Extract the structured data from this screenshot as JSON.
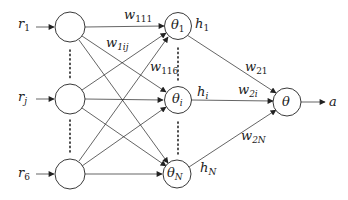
{
  "diagram": {
    "inputs": [
      {
        "symbol": "r",
        "sub": "1"
      },
      {
        "symbol": "r",
        "sub": "j"
      },
      {
        "symbol": "r",
        "sub": "6"
      }
    ],
    "hidden": [
      {
        "symbol": "θ",
        "sub": "1",
        "output": "h",
        "output_sub": "1"
      },
      {
        "symbol": "θ",
        "sub": "i",
        "output": "h",
        "output_sub": "i"
      },
      {
        "symbol": "θ",
        "sub": "N",
        "output": "h",
        "output_sub": "N"
      }
    ],
    "output_node": {
      "symbol": "θ",
      "result": "a"
    },
    "layer1_weights": [
      {
        "symbol": "w",
        "sub": "111"
      },
      {
        "symbol": "w",
        "sub": "1ij"
      },
      {
        "symbol": "w",
        "sub": "116"
      }
    ],
    "layer2_weights": [
      {
        "symbol": "w",
        "sub": "21"
      },
      {
        "symbol": "w",
        "sub": "2i"
      },
      {
        "symbol": "w",
        "sub": "2N"
      }
    ],
    "colors": {
      "stroke": "#222222",
      "background": "#ffffff"
    }
  }
}
